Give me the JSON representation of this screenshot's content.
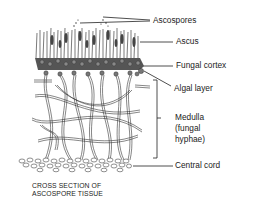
{
  "diagram": {
    "title": "CROSS SECTION OF ASCOSPORE TISSUE",
    "caption_lines": [
      "CROSS SECTION OF",
      "ASCOSPORE TISSUE"
    ],
    "labels": [
      {
        "id": "ascospores",
        "text": "Ascospores"
      },
      {
        "id": "ascus",
        "text": "Ascus"
      },
      {
        "id": "fungal-cortex",
        "text": "Fungal cortex"
      },
      {
        "id": "algal-layer",
        "text": "Algal layer"
      },
      {
        "id": "medulla",
        "lines": [
          "Medulla",
          "(fungal",
          "hyphae)"
        ]
      },
      {
        "id": "central-cord",
        "text": "Central cord"
      }
    ],
    "colors": {
      "ink": "#1a1a1a",
      "background": "#ffffff"
    }
  }
}
